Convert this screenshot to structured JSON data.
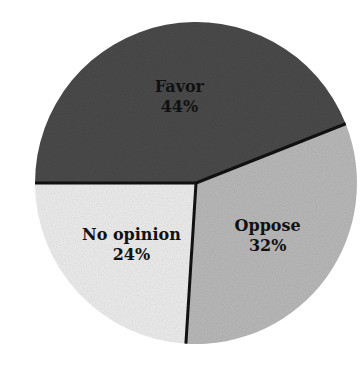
{
  "chart_data": {
    "type": "pie",
    "title": "",
    "categories": [
      "Favor",
      "Oppose",
      "No opinion"
    ],
    "values": [
      44,
      32,
      24
    ],
    "labels": [
      "44%",
      "32%",
      "24%"
    ],
    "colors": [
      "#4a4a4a",
      "#b9b9b9",
      "#ededed"
    ],
    "legend": "none (labels inside slices)",
    "start_angle_deg": 180,
    "direction": "clockwise"
  },
  "slices": [
    {
      "name": "Favor",
      "percent": "44%"
    },
    {
      "name": "Oppose",
      "percent": "32%"
    },
    {
      "name": "No opinion",
      "percent": "24%"
    }
  ],
  "geometry": {
    "cx": 196,
    "cy": 183,
    "r": 161
  }
}
